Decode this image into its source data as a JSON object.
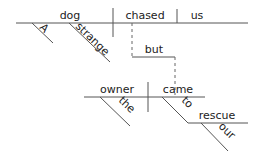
{
  "diagram": {
    "type": "sentence-diagram",
    "sentence": "A strange dog chased us but the owner came to our rescue",
    "words": {
      "subject": "dog",
      "verb": "chased",
      "object": "us",
      "modifier_a": "A",
      "modifier_strange": "strange",
      "conjunction": "but",
      "subject2": "owner",
      "verb2": "came",
      "modifier_the": "the",
      "preposition": "to",
      "prep_object": "rescue",
      "modifier_our": "our"
    },
    "colors": {
      "line": "#555555",
      "text": "#222222",
      "background": "#ffffff"
    }
  }
}
